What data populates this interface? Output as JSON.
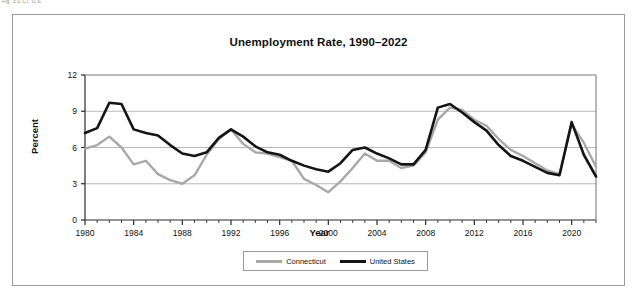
{
  "top_note": "Fig. 3-1 CT, U.S.",
  "figure": {
    "title": "Unemployment Rate, 1990–2022"
  },
  "legend": {
    "position": "bottom-center",
    "entries": [
      {
        "label": "Connecticut",
        "color": "#a8a8a8"
      },
      {
        "label": "United States",
        "color": "#151515"
      }
    ]
  },
  "chart_data": {
    "type": "line",
    "title": "Unemployment Rate, 1990–2022",
    "xlabel": "Year",
    "ylabel": "Percent",
    "xlim": [
      1980,
      2022
    ],
    "ylim": [
      0,
      12
    ],
    "ytick_values": [
      0,
      3,
      6,
      9,
      12
    ],
    "xtick_values": [
      1980,
      1984,
      1988,
      1992,
      1996,
      2000,
      2004,
      2008,
      2012,
      2016,
      2020
    ],
    "grid": "horizontal",
    "x": [
      1980,
      1981,
      1982,
      1983,
      1984,
      1985,
      1986,
      1987,
      1988,
      1989,
      1990,
      1991,
      1992,
      1993,
      1994,
      1995,
      1996,
      1997,
      1998,
      1999,
      2000,
      2001,
      2002,
      2003,
      2004,
      2005,
      2006,
      2007,
      2008,
      2009,
      2010,
      2011,
      2012,
      2013,
      2014,
      2015,
      2016,
      2017,
      2018,
      2019,
      2020,
      2021,
      2022
    ],
    "series": [
      {
        "name": "Connecticut",
        "color": "#a8a8a8",
        "values": [
          5.9,
          6.2,
          6.9,
          6.0,
          4.6,
          4.9,
          3.8,
          3.3,
          3.0,
          3.7,
          5.4,
          6.7,
          7.5,
          6.3,
          5.6,
          5.5,
          5.2,
          4.9,
          3.4,
          2.9,
          2.3,
          3.2,
          4.3,
          5.5,
          4.9,
          4.9,
          4.3,
          4.5,
          5.6,
          8.3,
          9.3,
          9.1,
          8.3,
          7.8,
          6.7,
          5.8,
          5.3,
          4.7,
          4.1,
          3.8,
          7.9,
          6.4,
          4.4
        ]
      },
      {
        "name": "United States",
        "color": "#151515",
        "values": [
          7.2,
          7.6,
          9.7,
          9.6,
          7.5,
          7.2,
          7.0,
          6.2,
          5.5,
          5.3,
          5.6,
          6.8,
          7.5,
          6.9,
          6.1,
          5.6,
          5.4,
          4.9,
          4.5,
          4.2,
          4.0,
          4.7,
          5.8,
          6.0,
          5.5,
          5.1,
          4.6,
          4.6,
          5.8,
          9.3,
          9.6,
          8.9,
          8.1,
          7.4,
          6.2,
          5.3,
          4.9,
          4.4,
          3.9,
          3.7,
          8.1,
          5.4,
          3.6
        ]
      }
    ]
  }
}
